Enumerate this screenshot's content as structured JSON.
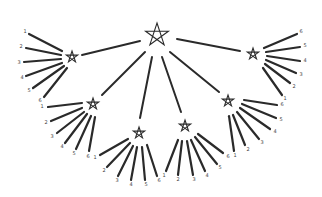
{
  "diagram": {
    "type": "hierarchical-star-tree",
    "root": {
      "id": "root",
      "x": 157,
      "y": 35,
      "size": 22,
      "shape": "pentagram"
    },
    "children": [
      {
        "id": "star-a",
        "x": 72,
        "y": 57,
        "size": 12,
        "rays": [
          {
            "label": "1",
            "x1": 62,
            "y1": 51,
            "x2": 29,
            "y2": 34,
            "lx": 25,
            "ly": 32
          },
          {
            "label": "2",
            "x1": 61,
            "y1": 55,
            "x2": 26,
            "y2": 48,
            "lx": 21,
            "ly": 47
          },
          {
            "label": "3",
            "x1": 61,
            "y1": 59,
            "x2": 24,
            "y2": 62,
            "lx": 19,
            "ly": 63
          },
          {
            "label": "4",
            "x1": 62,
            "y1": 63,
            "x2": 26,
            "y2": 76,
            "lx": 22,
            "ly": 78
          },
          {
            "label": "5",
            "x1": 64,
            "y1": 66,
            "x2": 33,
            "y2": 88,
            "lx": 29,
            "ly": 91
          },
          {
            "label": "6",
            "x1": 67,
            "y1": 68,
            "x2": 44,
            "y2": 97,
            "lx": 40,
            "ly": 101
          }
        ]
      },
      {
        "id": "star-b",
        "x": 93,
        "y": 104,
        "size": 12,
        "rays": [
          {
            "label": "1",
            "x1": 82,
            "y1": 103,
            "x2": 48,
            "y2": 107,
            "lx": 42,
            "ly": 107
          },
          {
            "label": "2",
            "x1": 82,
            "y1": 108,
            "x2": 51,
            "y2": 121,
            "lx": 46,
            "ly": 123
          },
          {
            "label": "3",
            "x1": 84,
            "y1": 112,
            "x2": 57,
            "y2": 133,
            "lx": 52,
            "ly": 137
          },
          {
            "label": "4",
            "x1": 87,
            "y1": 114,
            "x2": 65,
            "y2": 143,
            "lx": 62,
            "ly": 147
          },
          {
            "label": "5",
            "x1": 91,
            "y1": 116,
            "x2": 76,
            "y2": 149,
            "lx": 74,
            "ly": 154
          },
          {
            "label": "6",
            "x1": 95,
            "y1": 117,
            "x2": 89,
            "y2": 151,
            "lx": 88,
            "ly": 157
          }
        ]
      },
      {
        "id": "star-c",
        "x": 139,
        "y": 133,
        "size": 12,
        "rays": [
          {
            "label": "1",
            "x1": 128,
            "y1": 139,
            "x2": 100,
            "y2": 155,
            "lx": 95,
            "ly": 158
          },
          {
            "label": "2",
            "x1": 130,
            "y1": 143,
            "x2": 107,
            "y2": 167,
            "lx": 104,
            "ly": 171
          },
          {
            "label": "3",
            "x1": 133,
            "y1": 146,
            "x2": 118,
            "y2": 176,
            "lx": 117,
            "ly": 181
          },
          {
            "label": "4",
            "x1": 137,
            "y1": 147,
            "x2": 131,
            "y2": 180,
            "lx": 131,
            "ly": 185
          },
          {
            "label": "5",
            "x1": 142,
            "y1": 147,
            "x2": 145,
            "y2": 180,
            "lx": 146,
            "ly": 185
          },
          {
            "label": "6",
            "x1": 147,
            "y1": 145,
            "x2": 157,
            "y2": 176,
            "lx": 159,
            "ly": 181
          }
        ]
      },
      {
        "id": "star-d",
        "x": 185,
        "y": 126,
        "size": 12,
        "rays": [
          {
            "label": "1",
            "x1": 178,
            "y1": 140,
            "x2": 166,
            "y2": 171,
            "lx": 164,
            "ly": 176
          },
          {
            "label": "2",
            "x1": 182,
            "y1": 141,
            "x2": 178,
            "y2": 175,
            "lx": 178,
            "ly": 180
          },
          {
            "label": "3",
            "x1": 187,
            "y1": 141,
            "x2": 193,
            "y2": 175,
            "lx": 194,
            "ly": 180
          },
          {
            "label": "4",
            "x1": 191,
            "y1": 140,
            "x2": 205,
            "y2": 171,
            "lx": 207,
            "ly": 176
          },
          {
            "label": "5",
            "x1": 195,
            "y1": 137,
            "x2": 217,
            "y2": 164,
            "lx": 220,
            "ly": 168
          },
          {
            "label": "6",
            "x1": 198,
            "y1": 134,
            "x2": 223,
            "y2": 153,
            "lx": 228,
            "ly": 157
          }
        ]
      },
      {
        "id": "star-e",
        "x": 228,
        "y": 101,
        "size": 12,
        "rays": [
          {
            "label": "1",
            "x1": 229,
            "y1": 116,
            "x2": 234,
            "y2": 151,
            "lx": 235,
            "ly": 156
          },
          {
            "label": "2",
            "x1": 233,
            "y1": 115,
            "x2": 245,
            "y2": 145,
            "lx": 248,
            "ly": 150
          },
          {
            "label": "3",
            "x1": 237,
            "y1": 112,
            "x2": 259,
            "y2": 139,
            "lx": 262,
            "ly": 143
          },
          {
            "label": "4",
            "x1": 240,
            "y1": 108,
            "x2": 270,
            "y2": 129,
            "lx": 275,
            "ly": 132
          },
          {
            "label": "5",
            "x1": 242,
            "y1": 104,
            "x2": 276,
            "y2": 118,
            "lx": 281,
            "ly": 120
          },
          {
            "label": "6",
            "x1": 244,
            "y1": 100,
            "x2": 277,
            "y2": 105,
            "lx": 282,
            "ly": 105
          }
        ]
      },
      {
        "id": "star-f",
        "x": 253,
        "y": 54,
        "size": 12,
        "rays": [
          {
            "label": "1",
            "x1": 263,
            "y1": 68,
            "x2": 282,
            "y2": 95,
            "lx": 285,
            "ly": 99
          },
          {
            "label": "2",
            "x1": 265,
            "y1": 64,
            "x2": 290,
            "y2": 83,
            "lx": 294,
            "ly": 87
          },
          {
            "label": "3",
            "x1": 266,
            "y1": 60,
            "x2": 296,
            "y2": 73,
            "lx": 301,
            "ly": 75
          },
          {
            "label": "4",
            "x1": 267,
            "y1": 56,
            "x2": 300,
            "y2": 61,
            "lx": 305,
            "ly": 61
          },
          {
            "label": "5",
            "x1": 266,
            "y1": 52,
            "x2": 300,
            "y2": 47,
            "lx": 305,
            "ly": 46
          },
          {
            "label": "6",
            "x1": 264,
            "y1": 48,
            "x2": 297,
            "y2": 34,
            "lx": 301,
            "ly": 32
          }
        ]
      }
    ],
    "edges": [
      {
        "from": "root",
        "to": "star-a",
        "x1": 140,
        "y1": 41,
        "x2": 82,
        "y2": 55
      },
      {
        "from": "root",
        "to": "star-b",
        "x1": 145,
        "y1": 52,
        "x2": 102,
        "y2": 95
      },
      {
        "from": "root",
        "to": "star-c",
        "x1": 152,
        "y1": 57,
        "x2": 140,
        "y2": 118
      },
      {
        "from": "root",
        "to": "star-d",
        "x1": 162,
        "y1": 57,
        "x2": 181,
        "y2": 112
      },
      {
        "from": "root",
        "to": "star-e",
        "x1": 170,
        "y1": 52,
        "x2": 219,
        "y2": 92
      },
      {
        "from": "root",
        "to": "star-f",
        "x1": 177,
        "y1": 39,
        "x2": 240,
        "y2": 51
      }
    ],
    "colors": {
      "line": "#2a2a2a",
      "label": "#444444",
      "background": "#ffffff"
    }
  }
}
